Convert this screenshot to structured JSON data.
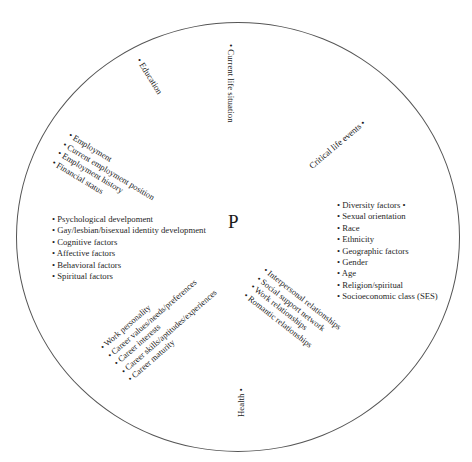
{
  "diagram": {
    "title_center": "P",
    "shape": "circle",
    "bullet_glyph": "•",
    "colors": {
      "background": "#ffffff",
      "outline": "#555555",
      "text": "#1f1f1f"
    },
    "sectors": {
      "education": {
        "name": "Education",
        "label": "• Education",
        "orientation": "diagonal-down-right",
        "items": []
      },
      "current_life_situation": {
        "name": "Current life situation",
        "label": "• Current life situation",
        "orientation": "vertical-top-to-bottom",
        "items": []
      },
      "critical_life_events": {
        "name": "Critical life events",
        "label": "Critical life events •",
        "orientation": "diagonal-up-right",
        "items": []
      },
      "employment": {
        "name": "Employment",
        "orientation": "diagonal-down-right",
        "items": [
          "• Employment",
          "• Current employment position",
          "• Employment history",
          "• Financial status"
        ]
      },
      "psychological": {
        "name": "Psychological develpoment",
        "orientation": "horizontal-left",
        "items": [
          "• Psychological develpoment",
          "• Gay/lesbian/bisexual identity development",
          "• Cognitive factors",
          "• Affective factors",
          "• Behavioral factors",
          "• Spiritual factors"
        ]
      },
      "diversity": {
        "name": "Diversity factors",
        "orientation": "horizontal-right",
        "items": [
          "• Diversity factors  •",
          "• Sexual orientation",
          "• Race",
          "• Ethnicity",
          "• Geographic factors",
          "• Gender",
          "• Age",
          "• Religion/spiritual",
          "• Socioeconomic class (SES)"
        ]
      },
      "work_personality": {
        "name": "Work personality",
        "orientation": "diagonal-up-right",
        "items": [
          "• Work personality",
          "• Career values/needs/preferences",
          "• Career interests",
          "• Career skills/aptitudes/experiences",
          "• Career maturity"
        ]
      },
      "interpersonal": {
        "name": "Interpersonal relationships",
        "orientation": "diagonal-down-right",
        "items": [
          "• Interpersonal relationships",
          "• Social support network",
          "• Work relationships",
          "• Romantic relationships"
        ]
      },
      "health": {
        "name": "Health",
        "label": "Health •",
        "orientation": "vertical-bottom-to-top",
        "items": []
      }
    }
  }
}
